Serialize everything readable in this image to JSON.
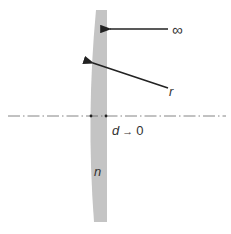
{
  "diagram": {
    "colors": {
      "lens_fill": "#c4c4c4",
      "arrow": "#222222",
      "axis": "#555555",
      "text": "#333333"
    },
    "labels": {
      "infinity": "∞",
      "radius": "r",
      "thickness": "d → 0",
      "index": "n"
    },
    "elements": [
      {
        "type": "lens",
        "shape": "plano-convex",
        "flat_side": "right",
        "curved_side": "left"
      },
      {
        "type": "optical-axis",
        "style": "dash-dot"
      },
      {
        "type": "arrow",
        "target": "flat surface",
        "label": "∞"
      },
      {
        "type": "arrow",
        "target": "curved surface",
        "label": "r"
      },
      {
        "type": "annotation",
        "label": "d → 0"
      },
      {
        "type": "annotation",
        "label": "n"
      }
    ]
  }
}
